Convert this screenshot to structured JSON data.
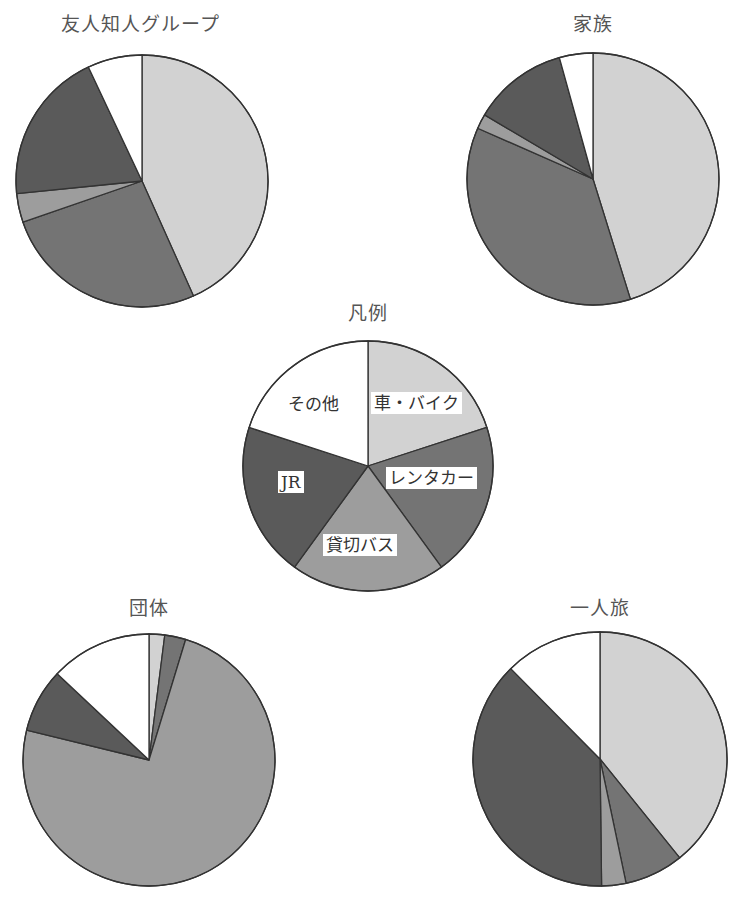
{
  "chart_data": [
    {
      "type": "pie",
      "id": "legend",
      "title": "凡例",
      "categories": [
        "車・バイク",
        "レンタカー",
        "貸切バス",
        "JR",
        "その他"
      ],
      "values": [
        20,
        20,
        20,
        20,
        20
      ],
      "start_angle": "12 o'clock, clockwise",
      "note": "Legend pie with equal slices showing category colors"
    },
    {
      "type": "pie",
      "id": "friends",
      "title": "友人知人グループ",
      "categories": [
        "車・バイク",
        "レンタカー",
        "貸切バス",
        "JR",
        "その他"
      ],
      "values": [
        43.3,
        26.4,
        3.7,
        19.6,
        7.0
      ],
      "unit": "% (estimated from slice angles)"
    },
    {
      "type": "pie",
      "id": "family",
      "title": "家族",
      "categories": [
        "車・バイク",
        "レンタカー",
        "貸切バス",
        "JR",
        "その他"
      ],
      "values": [
        45.2,
        36.4,
        1.9,
        12.2,
        4.3
      ],
      "unit": "% (estimated from slice angles)"
    },
    {
      "type": "pie",
      "id": "group",
      "title": "団体",
      "categories": [
        "車・バイク",
        "レンタカー",
        "貸切バス",
        "JR",
        "その他"
      ],
      "values": [
        2.0,
        2.7,
        74.1,
        8.2,
        13.0
      ],
      "unit": "% (estimated from slice angles)"
    },
    {
      "type": "pie",
      "id": "solo",
      "title": "一人旅",
      "categories": [
        "車・バイク",
        "レンタカー",
        "貸切バス",
        "JR",
        "その他"
      ],
      "values": [
        39.2,
        7.5,
        3.1,
        37.8,
        12.4
      ],
      "unit": "% (estimated from slice angles)"
    }
  ],
  "colors": {
    "車・バイク": "#d2d2d2",
    "レンタカー": "#747474",
    "貸切バス": "#9d9d9d",
    "JR": "#5a5a5a",
    "その他": "#ffffff",
    "outline": "#333333"
  },
  "titles": {
    "friends": "友人知人グループ",
    "family": "家族",
    "legend": "凡例",
    "group": "団体",
    "solo": "一人旅"
  },
  "legend_labels": {
    "car": "車・バイク",
    "rental": "レンタカー",
    "bus": "貸切バス",
    "jr": "JR",
    "other": "その他"
  }
}
